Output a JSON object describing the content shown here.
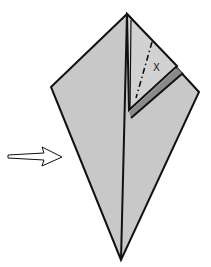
{
  "diagram": {
    "type": "origami-fold-step",
    "colors": {
      "paper": "#c8c8c8",
      "outline": "#111111",
      "shadow": "#8a8a8a",
      "background": "#ffffff"
    },
    "label_x": "X",
    "arrow": "push-arrow-right"
  }
}
